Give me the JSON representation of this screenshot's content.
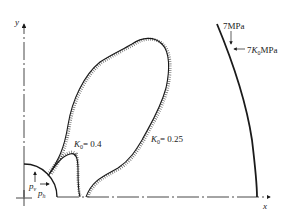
{
  "figure": {
    "axes": {
      "x_label": "x",
      "y_label": "y"
    },
    "boundary": {
      "inner_vertical_load": "7MPa",
      "inner_horizontal_load": "7",
      "inner_horizontal_load_k": "K",
      "inner_horizontal_load_sub": "0",
      "inner_horizontal_load_unit": "MPa"
    },
    "tunnel": {
      "pv_label": "p",
      "pv_sub": "v",
      "ph_label": "p",
      "ph_sub": "h"
    },
    "zones": [
      {
        "k_label": "K",
        "k_sub": "0",
        "value": "= 0.4"
      },
      {
        "k_label": "K",
        "k_sub": "0",
        "value": "= 0.25"
      }
    ],
    "colors": {
      "line": "#1a1a1a",
      "background": "#ffffff"
    }
  }
}
